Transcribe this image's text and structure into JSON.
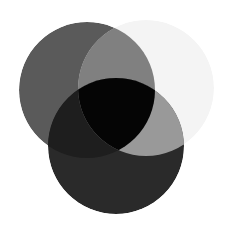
{
  "figure": {
    "width": 234,
    "height": 235,
    "background_color": "#ffffff"
  },
  "chart_data": {
    "type": "venn",
    "subtitle": "",
    "xlabel": "",
    "ylabel": "",
    "background_color": "#ffffff",
    "grid": false,
    "legend_position": "none",
    "set_count": 3,
    "blend_mode": "multiply",
    "sets": [
      {
        "id": "A",
        "name": "top-left-circle",
        "label": "",
        "cx": 87,
        "cy": 90,
        "r": 68,
        "fill": "#5a5a5a"
      },
      {
        "id": "B",
        "name": "top-right-circle",
        "label": "",
        "cx": 146,
        "cy": 88,
        "r": 68,
        "fill": "#f4f4f4"
      },
      {
        "id": "C",
        "name": "bottom-circle",
        "label": "",
        "cx": 116,
        "cy": 146,
        "r": 68,
        "fill": "#2a2a2a"
      }
    ],
    "regions": [
      {
        "id": "A_only",
        "sets": [
          "A"
        ],
        "fill": "#5a5a5a",
        "label": ""
      },
      {
        "id": "B_only",
        "sets": [
          "B"
        ],
        "fill": "#f4f4f4",
        "label": ""
      },
      {
        "id": "C_only",
        "sets": [
          "C"
        ],
        "fill": "#2a2a2a",
        "label": ""
      },
      {
        "id": "AB",
        "sets": [
          "A",
          "B"
        ],
        "fill": "#808080",
        "label": ""
      },
      {
        "id": "AC",
        "sets": [
          "A",
          "C"
        ],
        "fill": "#1e1e1e",
        "label": ""
      },
      {
        "id": "BC",
        "sets": [
          "B",
          "C"
        ],
        "fill": "#999999",
        "label": ""
      },
      {
        "id": "ABC",
        "sets": [
          "A",
          "B",
          "C"
        ],
        "fill": "#050505",
        "label": ""
      }
    ],
    "annotations": [],
    "tick_labels": [],
    "legend_entries": []
  }
}
